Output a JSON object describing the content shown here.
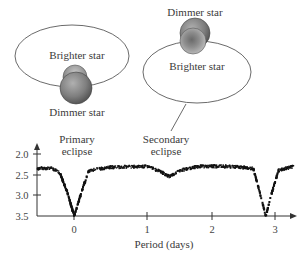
{
  "diagram": {
    "left_system": {
      "top_label": "Brighter star",
      "bottom_label": "Dimmer star",
      "configuration": "dimmer star in front of brighter star"
    },
    "right_system": {
      "top_label": "Dimmer star",
      "bottom_label": "Brighter star",
      "configuration": "brighter star in front of dimmer star"
    },
    "annotations": {
      "primary_line1": "Primary",
      "primary_line2": "eclipse",
      "secondary_line1": "Secondary",
      "secondary_line2": "eclipse"
    },
    "colors": {
      "star_fill": "#8a8a8a",
      "star_dark": "#555555",
      "orbit_line": "#444444",
      "data_points": "#111111"
    }
  },
  "chart_data": {
    "type": "scatter",
    "title": "",
    "xlabel": "Period (days)",
    "ylabel": "",
    "x_ticks": [
      "0",
      "1",
      "2",
      "3"
    ],
    "y_ticks": [
      "2.0",
      "2.5",
      "3.0",
      "3.5"
    ],
    "xlim": [
      -0.5,
      3.3
    ],
    "ylim": [
      3.5,
      2.0
    ],
    "y_inverted": true,
    "grid": false,
    "legend": null,
    "series": [
      {
        "name": "light curve (magnitude)",
        "baseline": 2.3,
        "features": [
          {
            "name": "Primary eclipse",
            "x": 0.0,
            "min_y": 3.5
          },
          {
            "name": "Secondary eclipse",
            "x": 1.35,
            "min_y": 2.55
          },
          {
            "name": "Primary eclipse",
            "x": 2.85,
            "min_y": 3.5
          }
        ],
        "points_sample": [
          {
            "x": -0.5,
            "y": 2.35
          },
          {
            "x": -0.3,
            "y": 2.35
          },
          {
            "x": -0.2,
            "y": 2.45
          },
          {
            "x": -0.1,
            "y": 2.9
          },
          {
            "x": 0.0,
            "y": 3.5
          },
          {
            "x": 0.1,
            "y": 2.9
          },
          {
            "x": 0.2,
            "y": 2.4
          },
          {
            "x": 0.5,
            "y": 2.32
          },
          {
            "x": 1.0,
            "y": 2.3
          },
          {
            "x": 1.2,
            "y": 2.42
          },
          {
            "x": 1.35,
            "y": 2.55
          },
          {
            "x": 1.5,
            "y": 2.4
          },
          {
            "x": 1.8,
            "y": 2.3
          },
          {
            "x": 2.3,
            "y": 2.3
          },
          {
            "x": 2.65,
            "y": 2.35
          },
          {
            "x": 2.75,
            "y": 2.9
          },
          {
            "x": 2.85,
            "y": 3.5
          },
          {
            "x": 2.95,
            "y": 2.9
          },
          {
            "x": 3.05,
            "y": 2.4
          },
          {
            "x": 3.3,
            "y": 2.3
          }
        ]
      }
    ]
  }
}
